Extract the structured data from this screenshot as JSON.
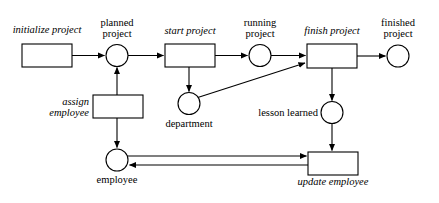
{
  "diagram": {
    "kind": "petri-net",
    "colors": {
      "stroke": "#000000",
      "fill": "#ffffff",
      "background": "#ffffff"
    },
    "places": [
      {
        "id": "planned-project",
        "label": "planned\nproject",
        "label_line1": "planned",
        "label_line2": "project",
        "cx": 117,
        "cy": 55,
        "r": 11
      },
      {
        "id": "running-project",
        "label": "running\nproject",
        "label_line1": "running",
        "label_line2": "project",
        "cx": 260,
        "cy": 55,
        "r": 11
      },
      {
        "id": "finished-project",
        "label": "finished\nproject",
        "label_line1": "finished",
        "label_line2": "project",
        "cx": 398,
        "cy": 56,
        "r": 11
      },
      {
        "id": "department",
        "label": "department",
        "cx": 189,
        "cy": 104,
        "r": 11
      },
      {
        "id": "lesson-learned",
        "label": "lesson learned",
        "cx": 332,
        "cy": 113,
        "r": 11
      },
      {
        "id": "employee",
        "label": "employee",
        "cx": 117,
        "cy": 160,
        "r": 11
      }
    ],
    "transitions": [
      {
        "id": "initialize-project",
        "label": "initialize project",
        "x": 22,
        "y": 44,
        "width": 50,
        "height": 23
      },
      {
        "id": "start-project",
        "label": "start project",
        "x": 165,
        "y": 44,
        "width": 50,
        "height": 23
      },
      {
        "id": "finish-project",
        "label": "finish project",
        "x": 307,
        "y": 44,
        "width": 50,
        "height": 24
      },
      {
        "id": "assign-employee",
        "label": "assign\nemployee",
        "label_line1": "assign",
        "label_line2": "employee",
        "x": 93,
        "y": 95,
        "width": 50,
        "height": 23
      },
      {
        "id": "update-employee",
        "label": "update employee",
        "x": 308,
        "y": 152,
        "width": 50,
        "height": 23
      }
    ],
    "arcs": [
      {
        "id": "arc-initialize-to-planned",
        "from": "initialize-project",
        "to": "planned-project"
      },
      {
        "id": "arc-planned-to-start",
        "from": "planned-project",
        "to": "start-project"
      },
      {
        "id": "arc-assign-to-planned",
        "from": "assign-employee",
        "to": "planned-project"
      },
      {
        "id": "arc-start-to-running",
        "from": "start-project",
        "to": "running-project"
      },
      {
        "id": "arc-start-to-department",
        "from": "start-project",
        "to": "department"
      },
      {
        "id": "arc-running-to-finish",
        "from": "running-project",
        "to": "finish-project"
      },
      {
        "id": "arc-department-to-finish",
        "from": "department",
        "to": "finish-project"
      },
      {
        "id": "arc-finish-to-finished",
        "from": "finish-project",
        "to": "finished-project"
      },
      {
        "id": "arc-finish-to-lesson",
        "from": "finish-project",
        "to": "lesson-learned"
      },
      {
        "id": "arc-lesson-to-update",
        "from": "lesson-learned",
        "to": "update-employee"
      },
      {
        "id": "arc-assign-to-employee",
        "from": "assign-employee",
        "to": "employee"
      },
      {
        "id": "arc-employee-to-update",
        "from": "employee",
        "to": "update-employee"
      },
      {
        "id": "arc-update-to-employee",
        "from": "update-employee",
        "to": "employee"
      }
    ]
  }
}
